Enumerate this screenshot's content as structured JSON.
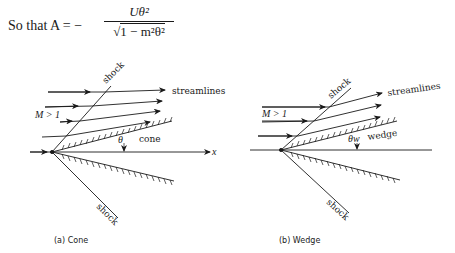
{
  "equation": {
    "lead": "So that A = −",
    "numerator": "Uθ²",
    "denominator_sqrt": "√",
    "denominator_body": "1 − m²θ²"
  },
  "figure_a": {
    "caption": "(a) Cone",
    "shock_top_label": "shock",
    "shock_bottom_label": "shock",
    "streamlines_label": "streamlines",
    "mach_label": "M > 1",
    "angle_label": "θ",
    "body_label": "cone",
    "axis_label": "x"
  },
  "figure_b": {
    "caption": "(b) Wedge",
    "shock_top_label": "shock",
    "shock_bottom_label": "shock",
    "streamlines_label": "streamlines",
    "mach_label": "M > 1",
    "angle_label": "θw",
    "body_label": "wedge"
  },
  "colors": {
    "ink": "#1a1a1a",
    "background": "#ffffff"
  }
}
